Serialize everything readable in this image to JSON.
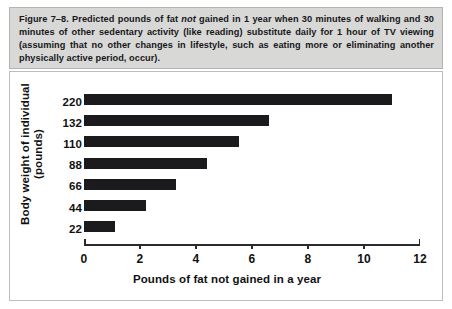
{
  "figure": {
    "caption_label": "Figure 7–8.",
    "caption_before_italic": " Predicted pounds of fat ",
    "caption_italic": "not",
    "caption_after_italic": " gained in 1 year when 30 minutes of walking and 30 minutes of other sedentary activity (like reading) substitute daily for 1 hour of TV viewing (assuming that no other changes in lifestyle, such as eating more or eliminating another physically active period, occur).",
    "caption_full": "Figure 7–8. Predicted pounds of fat not gained in 1 year when 30 minutes of walking and 30 minutes of other sedentary activity (like reading) substitute daily for 1 hour of TV viewing (assuming that no other changes in lifestyle, such as eating more or eliminating another physically active period, occur)."
  },
  "colors": {
    "bar": "#1b1b1d",
    "caption_background": "#d8d8d6",
    "caption_border": "#b4b4b2",
    "chart_background": "#ffffff",
    "chart_border": "#bdbdbb",
    "axis": "#2b2b2e",
    "text": "#111114"
  },
  "chart_data": {
    "type": "bar",
    "orientation": "horizontal",
    "title": "",
    "xlabel": "Pounds of fat not gained in a year",
    "ylabel": "Body weight of individual (pounds)",
    "categories": [
      "220",
      "132",
      "110",
      "88",
      "66",
      "44",
      "22"
    ],
    "values": [
      11.0,
      6.6,
      5.55,
      4.4,
      3.3,
      2.2,
      1.1
    ],
    "xlim": [
      0,
      12
    ],
    "xticks": [
      "0",
      "2",
      "4",
      "6",
      "8",
      "10",
      "12"
    ],
    "xtick_values": [
      0,
      2,
      4,
      6,
      8,
      10,
      12
    ],
    "grid": false,
    "legend": "none"
  }
}
